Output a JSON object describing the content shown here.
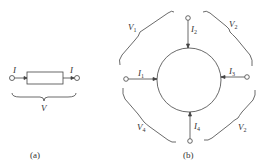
{
  "figure_a": {
    "current_left": "I",
    "current_right": "I",
    "voltage": "V",
    "caption": "(a)"
  },
  "figure_b": {
    "labels": {
      "V1": {
        "main": "V",
        "sub": "1"
      },
      "V2_top": {
        "main": "V",
        "sub": "2"
      },
      "V4": {
        "main": "V",
        "sub": "4"
      },
      "V2_bottom": {
        "main": "V",
        "sub": "2"
      },
      "I1": {
        "main": "I",
        "sub": "1"
      },
      "I2": {
        "main": "I",
        "sub": "2"
      },
      "I3": {
        "main": "I",
        "sub": "3"
      },
      "I4": {
        "main": "I",
        "sub": "4"
      }
    },
    "caption": "(b)"
  },
  "colors": {
    "stroke": "#444444",
    "background": "#ffffff"
  }
}
